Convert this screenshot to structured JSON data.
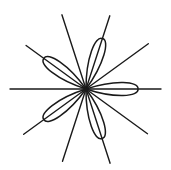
{
  "diagram": {
    "type": "rose-with-radial-lines",
    "center": [
      86,
      89
    ],
    "stroke_color": "#1a1a1a",
    "background": "#ffffff",
    "lines": [
      {
        "angle_deg": 0,
        "length_pos": 75,
        "length_neg": 76
      },
      {
        "angle_deg": 36,
        "length_pos": 77,
        "length_neg": 77
      },
      {
        "angle_deg": 72,
        "length_pos": 77,
        "length_neg": 76
      },
      {
        "angle_deg": 108,
        "length_pos": 78,
        "length_neg": 78
      },
      {
        "angle_deg": 144,
        "length_pos": 74,
        "length_neg": 76
      }
    ],
    "petals": [
      {
        "angle_deg": 0,
        "length": 52,
        "half_width": 6
      },
      {
        "angle_deg": 72,
        "length": 53,
        "half_width": 6
      },
      {
        "angle_deg": 144,
        "length": 52,
        "half_width": 6
      },
      {
        "angle_deg": 216,
        "length": 52,
        "half_width": 6
      },
      {
        "angle_deg": 288,
        "length": 52,
        "half_width": 6
      }
    ]
  }
}
